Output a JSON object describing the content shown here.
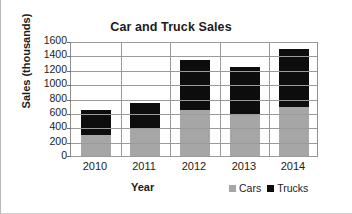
{
  "chart_data": {
    "type": "bar",
    "subtype": "stacked-bar",
    "title": "Car and Truck Sales",
    "xlabel": "Year",
    "ylabel": "Sales (thousands)",
    "categories": [
      "2010",
      "2011",
      "2012",
      "2013",
      "2014"
    ],
    "series": [
      {
        "name": "Cars",
        "color": "#a6a6a6",
        "values": [
          300,
          400,
          650,
          600,
          700
        ]
      },
      {
        "name": "Trucks",
        "color": "#0d0d0d",
        "values": [
          350,
          350,
          700,
          650,
          800
        ]
      }
    ],
    "totals": [
      650,
      750,
      1350,
      1250,
      1500
    ],
    "ylim": [
      0,
      1600
    ],
    "ytick_values": [
      0,
      200,
      400,
      600,
      800,
      1000,
      1200,
      1400,
      1600
    ],
    "ytick_labels": [
      "0",
      "200",
      "400",
      "600",
      "800",
      "1000",
      "1200",
      "1400",
      "1600"
    ],
    "grid": "horizontal-and-vertical",
    "legend_position": "bottom-right",
    "legend": [
      "Cars",
      "Trucks"
    ]
  }
}
